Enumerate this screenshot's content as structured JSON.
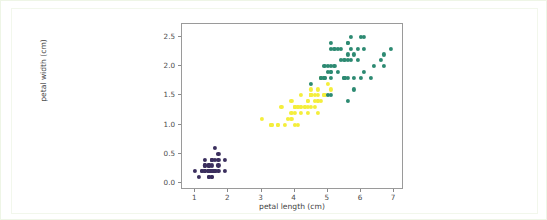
{
  "figure": {
    "background": "#ffffff",
    "card_border": "#f2f7ec",
    "outer_border": "#eef5e6",
    "axes_edge": "#9a9a9a"
  },
  "chart_data": {
    "type": "scatter",
    "title": "",
    "xlabel": "petal length (cm)",
    "ylabel": "petal width (cm)",
    "xlim": [
      0.6,
      7.3
    ],
    "ylim": [
      -0.12,
      2.72
    ],
    "xticks": [
      1,
      2,
      3,
      4,
      5,
      6,
      7
    ],
    "xticklabels": [
      "1",
      "2",
      "3",
      "4",
      "5",
      "6",
      "7"
    ],
    "yticks": [
      0.0,
      0.5,
      1.0,
      1.5,
      2.0,
      2.5
    ],
    "yticklabels": [
      "0.0",
      "0.5",
      "1.0",
      "1.5",
      "2.0",
      "2.5"
    ],
    "grid": false,
    "legend": null,
    "colormap": "viridis",
    "marker": "circle",
    "marker_size": 4.2,
    "series": [
      {
        "name": "setosa",
        "color": "#3b2f5e",
        "x": [
          1.4,
          1.4,
          1.3,
          1.5,
          1.4,
          1.7,
          1.4,
          1.5,
          1.4,
          1.5,
          1.5,
          1.6,
          1.4,
          1.1,
          1.2,
          1.5,
          1.3,
          1.4,
          1.7,
          1.5,
          1.7,
          1.5,
          1.0,
          1.7,
          1.9,
          1.6,
          1.6,
          1.5,
          1.4,
          1.6,
          1.6,
          1.5,
          1.5,
          1.4,
          1.5,
          1.2,
          1.3,
          1.4,
          1.3,
          1.5,
          1.3,
          1.3,
          1.3,
          1.6,
          1.9,
          1.4,
          1.6,
          1.4,
          1.5,
          1.4
        ],
        "y": [
          0.2,
          0.2,
          0.2,
          0.2,
          0.2,
          0.4,
          0.3,
          0.2,
          0.2,
          0.1,
          0.2,
          0.2,
          0.1,
          0.1,
          0.2,
          0.4,
          0.4,
          0.3,
          0.3,
          0.3,
          0.2,
          0.4,
          0.2,
          0.5,
          0.2,
          0.2,
          0.4,
          0.2,
          0.2,
          0.2,
          0.2,
          0.4,
          0.1,
          0.2,
          0.2,
          0.2,
          0.2,
          0.1,
          0.2,
          0.2,
          0.3,
          0.3,
          0.2,
          0.6,
          0.4,
          0.3,
          0.2,
          0.2,
          0.2,
          0.2
        ]
      },
      {
        "name": "versicolor",
        "color": "#f4ee3c",
        "x": [
          4.7,
          4.5,
          4.9,
          4.0,
          4.6,
          4.5,
          4.7,
          3.3,
          4.6,
          3.9,
          3.5,
          4.2,
          4.0,
          4.7,
          3.6,
          4.4,
          4.5,
          4.1,
          4.5,
          3.9,
          4.8,
          4.0,
          4.9,
          4.7,
          4.3,
          4.4,
          4.8,
          5.0,
          4.5,
          3.5,
          3.8,
          3.7,
          3.9,
          5.1,
          4.5,
          4.5,
          4.7,
          4.4,
          4.1,
          4.0,
          4.4,
          4.6,
          4.0,
          3.3,
          4.2,
          4.2,
          4.2,
          4.3,
          3.0,
          4.1
        ],
        "y": [
          1.4,
          1.5,
          1.5,
          1.3,
          1.5,
          1.3,
          1.6,
          1.0,
          1.3,
          1.4,
          1.0,
          1.5,
          1.0,
          1.4,
          1.3,
          1.4,
          1.5,
          1.0,
          1.5,
          1.1,
          1.8,
          1.3,
          1.5,
          1.2,
          1.3,
          1.4,
          1.4,
          1.7,
          1.5,
          1.0,
          1.1,
          1.0,
          1.2,
          1.6,
          1.5,
          1.6,
          1.5,
          1.3,
          1.3,
          1.3,
          1.2,
          1.4,
          1.2,
          1.0,
          1.3,
          1.2,
          1.3,
          1.3,
          1.1,
          1.3
        ]
      },
      {
        "name": "virginica",
        "color": "#2d8a72",
        "x": [
          6.0,
          5.1,
          5.9,
          5.6,
          5.8,
          6.6,
          4.5,
          6.3,
          5.8,
          6.1,
          5.1,
          5.3,
          5.5,
          5.0,
          5.1,
          5.3,
          5.5,
          6.7,
          6.9,
          5.0,
          5.7,
          4.9,
          6.7,
          4.9,
          5.7,
          6.0,
          4.8,
          4.9,
          5.6,
          5.8,
          6.1,
          6.4,
          5.6,
          5.1,
          5.6,
          6.1,
          5.6,
          5.5,
          4.8,
          5.4,
          5.6,
          5.1,
          5.1,
          5.9,
          5.7,
          5.2,
          5.0,
          5.2,
          5.4,
          5.1
        ],
        "y": [
          2.5,
          1.9,
          2.1,
          1.8,
          2.2,
          2.1,
          1.7,
          1.8,
          1.8,
          2.5,
          2.0,
          1.9,
          2.1,
          2.0,
          2.4,
          2.3,
          1.8,
          2.2,
          2.3,
          1.5,
          2.3,
          2.0,
          2.0,
          1.8,
          2.1,
          1.8,
          1.8,
          1.8,
          2.1,
          1.6,
          1.9,
          2.0,
          2.2,
          1.5,
          1.4,
          2.3,
          2.4,
          1.8,
          1.8,
          2.1,
          2.4,
          2.3,
          1.9,
          2.3,
          2.5,
          2.3,
          1.9,
          2.0,
          2.3,
          1.8
        ]
      }
    ]
  }
}
